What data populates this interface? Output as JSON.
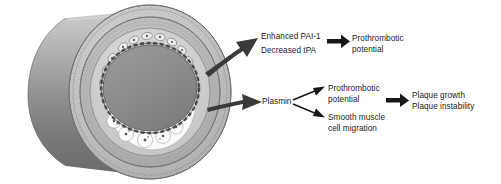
{
  "figure": {
    "illustration": {
      "name": "blood-vessel-cross-section",
      "description": "Cut-away cylindrical artery showing lumen, vessel wall layers and foam-cell plaque along the lower inner wall",
      "parts": [
        {
          "name": "vessel-tube",
          "label": "Artery tube"
        },
        {
          "name": "adventitia-ring",
          "label": "Outer vessel wall"
        },
        {
          "name": "media-ring",
          "label": "Vessel wall media"
        },
        {
          "name": "intima-ring",
          "label": "Intima"
        },
        {
          "name": "endothelium-ring",
          "label": "Endothelial lining"
        },
        {
          "name": "lumen",
          "label": "Lumen"
        },
        {
          "name": "plaque",
          "label": "Atherosclerotic plaque with foam cells"
        }
      ]
    },
    "colors": {
      "background": "#ffffff",
      "tube_light": "#b9b9b9",
      "tube_dark": "#6e6e6e",
      "wall_outer": "#c9c9c9",
      "wall_mid": "#b0b0b0",
      "wall_inner": "#d2d2d2",
      "lumen": "#8e8e8e",
      "plaque": "#fbfbfb",
      "arrow": "#2b2b2b",
      "text": "#1a1a1a"
    }
  },
  "pathways": {
    "upper": {
      "source_arrow": "thick-arrow-upper",
      "mediators": [
        {
          "id": "enhanced-pai-1",
          "text": "Enhanced PAI-1"
        },
        {
          "id": "decreased-tpa",
          "text": "Decreased tPA"
        }
      ],
      "arrow": "arrow-to-prothrombotic-upper",
      "outcome": {
        "id": "prothrombotic-potential-upper",
        "line1": "Prothrombotic",
        "line2": "potential"
      }
    },
    "lower": {
      "source_arrow": "thick-arrow-lower",
      "mediator": {
        "id": "plasmin",
        "text": "Plasmin"
      },
      "branch_arrows": [
        "branch-arrow-up",
        "branch-arrow-down"
      ],
      "branches": [
        {
          "id": "prothrombotic-potential-lower",
          "line1": "Prothrombotic",
          "line2": "potential"
        },
        {
          "id": "smooth-muscle-cell-migration",
          "line1": "Smooth muscle",
          "line2": "cell migration"
        }
      ],
      "arrow": "arrow-to-plaque-outcome",
      "outcome": {
        "id": "plaque-outcome",
        "line1": "Plaque growth",
        "line2": "Plaque instability"
      }
    }
  }
}
